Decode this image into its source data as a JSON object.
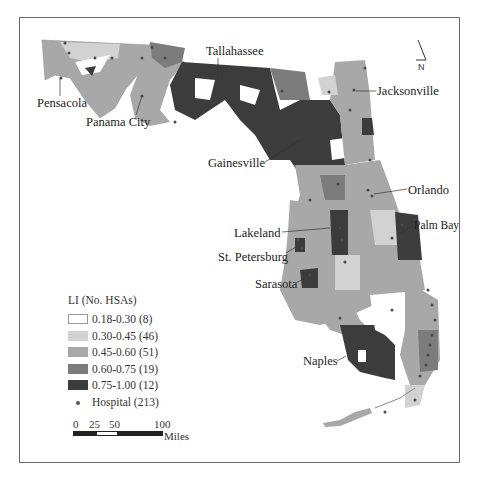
{
  "map": {
    "title": "Florida HSA Localization Index map",
    "north_arrow_label": "N",
    "cities": [
      {
        "name": "Tallahassee",
        "x": 206,
        "y": 45
      },
      {
        "name": "Pensacola",
        "x": 37,
        "y": 97
      },
      {
        "name": "Panama City",
        "x": 86,
        "y": 116
      },
      {
        "name": "Jacksonville",
        "x": 377,
        "y": 85
      },
      {
        "name": "Gainesville",
        "x": 208,
        "y": 157
      },
      {
        "name": "Orlando",
        "x": 408,
        "y": 184
      },
      {
        "name": "Lakeland",
        "x": 234,
        "y": 227
      },
      {
        "name": "Palm Bay",
        "x": 414,
        "y": 220
      },
      {
        "name": "St. Petersburg",
        "x": 218,
        "y": 251
      },
      {
        "name": "Sarasota",
        "x": 255,
        "y": 278
      },
      {
        "name": "Naples",
        "x": 303,
        "y": 355
      }
    ]
  },
  "legend": {
    "title": "LI (No. HSAs)",
    "classes": [
      {
        "label": "0.18-0.30 (8)",
        "color": "#ffffff"
      },
      {
        "label": "0.30-0.45 (46)",
        "color": "#d2d2d2"
      },
      {
        "label": "0.45-0.60 (51)",
        "color": "#a8a8a8"
      },
      {
        "label": "0.60-0.75 (19)",
        "color": "#7c7c7c"
      },
      {
        "label": "0.75-1.00 (12)",
        "color": "#3c3c3c"
      }
    ],
    "hospital_label": "Hospital (213)",
    "hospital_color": "#4a4a4a"
  },
  "scale_bar": {
    "ticks": [
      "0",
      "25",
      "50",
      "100"
    ],
    "unit": "Miles"
  }
}
